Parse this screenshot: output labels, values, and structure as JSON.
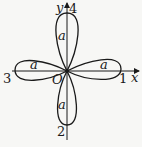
{
  "figure": {
    "axes": {
      "x_label": "x",
      "y_label": "y",
      "origin_label": "O"
    },
    "petal_tip_labels": {
      "right": "1",
      "down": "2",
      "left": "3",
      "up": "4"
    },
    "petal_labels": {
      "up": "a",
      "right": "a",
      "left": "a",
      "down": "a"
    },
    "colors": {
      "stroke": "#1a1a1a",
      "background": "#f7f7f5"
    }
  }
}
